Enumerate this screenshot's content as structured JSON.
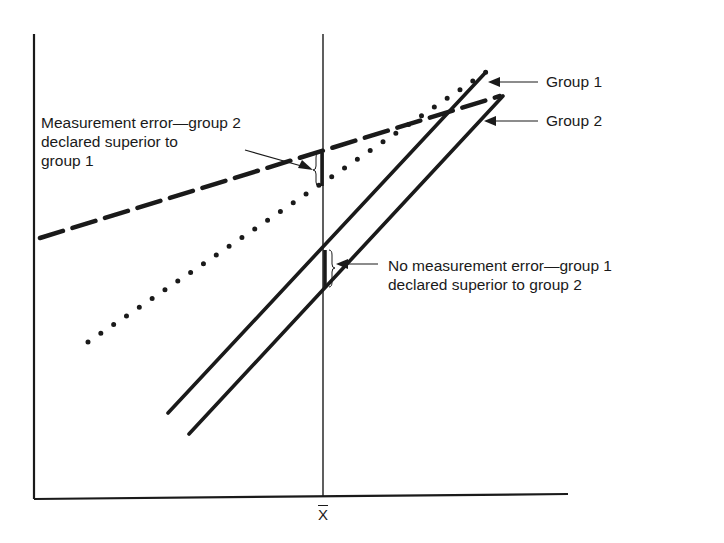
{
  "diagram": {
    "x_axis_tick_label": "X",
    "x_axis_tick_meaning": "x-bar (mean)",
    "legend": {
      "group1": "Group 1",
      "group2": "Group 2"
    },
    "annotations": {
      "measurement_error": {
        "line1": "Measurement error—group 2",
        "line2": "declared superior to",
        "line3": "group 1"
      },
      "no_measurement_error": {
        "line1": "No measurement error—group 1",
        "line2": "declared superior to group 2"
      }
    },
    "colors": {
      "ink": "#1a1a1a",
      "background": "#ffffff"
    }
  }
}
